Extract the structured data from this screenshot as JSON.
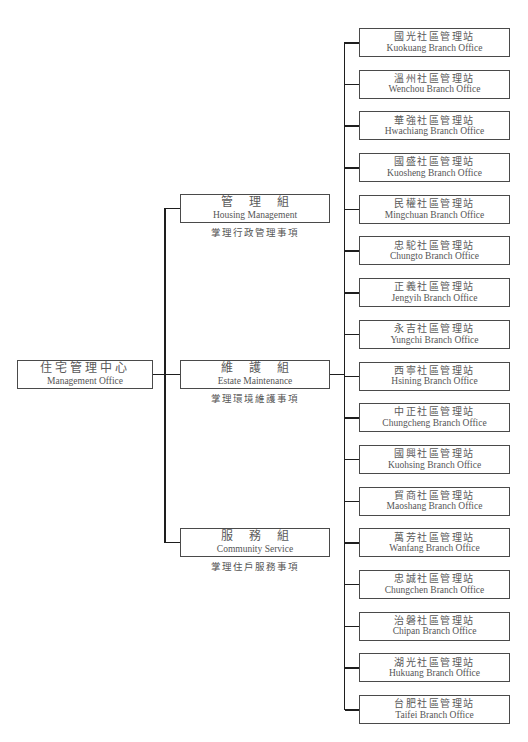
{
  "main_office": {
    "zh": "住宅管理中心",
    "en": "Management Office"
  },
  "divisions": [
    {
      "zh": "管理組",
      "en": "Housing Management",
      "caption": "掌理行政管理事項"
    },
    {
      "zh": "維護組",
      "en": "Estate Maintenance",
      "caption": "掌理環境維護事項"
    },
    {
      "zh": "服務組",
      "en": "Community Service",
      "caption": "掌理住戶服務事項"
    }
  ],
  "branches": [
    {
      "zh": "國光社區管理站",
      "en": "Kuokuang Branch Office"
    },
    {
      "zh": "溫州社區管理站",
      "en": "Wenchou Branch Office"
    },
    {
      "zh": "華強社區管理站",
      "en": "Hwachiang Branch Office"
    },
    {
      "zh": "國盛社區管理站",
      "en": "Kuosheng Branch Office"
    },
    {
      "zh": "民權社區管理站",
      "en": "Mingchuan Branch Office"
    },
    {
      "zh": "忠駝社區管理站",
      "en": "Chungto Branch Office"
    },
    {
      "zh": "正義社區管理站",
      "en": "Jengyih Branch Office"
    },
    {
      "zh": "永吉社區管理站",
      "en": "Yungchi Branch Office"
    },
    {
      "zh": "西寧社區管理站",
      "en": "Hsining Branch Office"
    },
    {
      "zh": "中正社區管理站",
      "en": "Chungcheng Branch Office"
    },
    {
      "zh": "國興社區管理站",
      "en": "Kuohsing Branch Office"
    },
    {
      "zh": "貿商社區管理站",
      "en": "Maoshang Branch Office"
    },
    {
      "zh": "萬芳社區管理站",
      "en": "Wanfang Branch Office"
    },
    {
      "zh": "忠誠社區管理站",
      "en": "Chungchen Branch Office"
    },
    {
      "zh": "治磐社區管理站",
      "en": "Chipan Branch Office"
    },
    {
      "zh": "湖光社區管理站",
      "en": "Hukuang Branch Office"
    },
    {
      "zh": "台肥社區管理站",
      "en": "Taifei Branch Office"
    }
  ],
  "colors": {
    "line": "#1e1e1e",
    "box_border": "#4a4a4a",
    "text": "#555555",
    "background": "#ffffff"
  }
}
